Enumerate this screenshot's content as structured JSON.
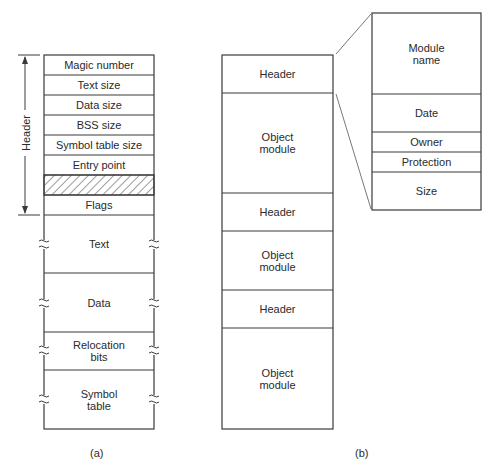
{
  "figure_a": {
    "caption": "(a)",
    "header_brace_label": "Header",
    "rows": [
      {
        "label": "Magic number"
      },
      {
        "label": "Text size"
      },
      {
        "label": "Data size"
      },
      {
        "label": "BSS size"
      },
      {
        "label": "Symbol table size"
      },
      {
        "label": "Entry point"
      },
      {
        "label": "",
        "hatched": true
      },
      {
        "label": "Flags"
      },
      {
        "label": "Text"
      },
      {
        "label": "Data"
      },
      {
        "label": "Relocation\nbits"
      },
      {
        "label": "Symbol\ntable"
      }
    ]
  },
  "figure_b": {
    "caption": "(b)",
    "rows": [
      {
        "label": "Header"
      },
      {
        "label": "Object\nmodule"
      },
      {
        "label": "Header"
      },
      {
        "label": "Object\nmodule"
      },
      {
        "label": "Header"
      },
      {
        "label": "Object\nmodule"
      }
    ]
  },
  "header_detail": {
    "rows": [
      {
        "label": "Module\nname"
      },
      {
        "label": "Date"
      },
      {
        "label": "Owner"
      },
      {
        "label": "Protection"
      },
      {
        "label": "Size"
      }
    ]
  },
  "colors": {
    "line": "#3a3a3a",
    "text": "#2a2a2a",
    "background": "#ffffff"
  }
}
